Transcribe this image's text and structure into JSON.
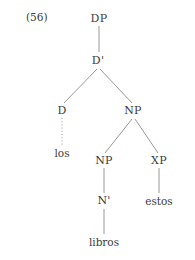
{
  "figure": {
    "example_number": "(56)",
    "background_color": "#ffffff",
    "text_color": "#3c3c3c",
    "line_color": "#8d8d8d"
  },
  "tree": {
    "nodes": [
      {
        "id": "dp",
        "label": "DP",
        "x": 99,
        "y": 18,
        "kind": "nonterminal"
      },
      {
        "id": "dbar",
        "label": "D'",
        "x": 98,
        "y": 60,
        "kind": "nonterminal"
      },
      {
        "id": "d",
        "label": "D",
        "x": 62,
        "y": 110,
        "kind": "nonterminal"
      },
      {
        "id": "np_top",
        "label": "NP",
        "x": 133,
        "y": 110,
        "kind": "nonterminal"
      },
      {
        "id": "los",
        "label": "los",
        "x": 62,
        "y": 153,
        "kind": "terminal"
      },
      {
        "id": "np_low",
        "label": "NP",
        "x": 104,
        "y": 160,
        "kind": "nonterminal"
      },
      {
        "id": "xp",
        "label": "XP",
        "x": 159,
        "y": 160,
        "kind": "nonterminal"
      },
      {
        "id": "nbar",
        "label": "N'",
        "x": 104,
        "y": 200,
        "kind": "nonterminal"
      },
      {
        "id": "estos",
        "label": "estos",
        "x": 159,
        "y": 201,
        "kind": "terminal"
      },
      {
        "id": "libros",
        "label": "libros",
        "x": 104,
        "y": 242,
        "kind": "terminal"
      }
    ],
    "edges": [
      {
        "from": "dp",
        "to": "dbar",
        "x1": 99,
        "y1": 26,
        "x2": 99,
        "y2": 52,
        "style": "solid"
      },
      {
        "from": "dbar",
        "to": "d",
        "x1": 97,
        "y1": 69,
        "x2": 64,
        "y2": 103,
        "style": "solid"
      },
      {
        "from": "dbar",
        "to": "np_top",
        "x1": 100,
        "y1": 69,
        "x2": 132,
        "y2": 103,
        "style": "solid"
      },
      {
        "from": "d",
        "to": "los",
        "x1": 62,
        "y1": 118,
        "x2": 62,
        "y2": 146,
        "style": "dotted"
      },
      {
        "from": "np_top",
        "to": "np_low",
        "x1": 132,
        "y1": 119,
        "x2": 105,
        "y2": 153,
        "style": "solid"
      },
      {
        "from": "np_top",
        "to": "xp",
        "x1": 135,
        "y1": 119,
        "x2": 158,
        "y2": 153,
        "style": "solid"
      },
      {
        "from": "np_low",
        "to": "nbar",
        "x1": 104,
        "y1": 168,
        "x2": 104,
        "y2": 193,
        "style": "solid"
      },
      {
        "from": "xp",
        "to": "estos",
        "x1": 159,
        "y1": 168,
        "x2": 159,
        "y2": 193,
        "style": "solid"
      },
      {
        "from": "nbar",
        "to": "libros",
        "x1": 104,
        "y1": 209,
        "x2": 104,
        "y2": 234,
        "style": "solid"
      }
    ]
  }
}
